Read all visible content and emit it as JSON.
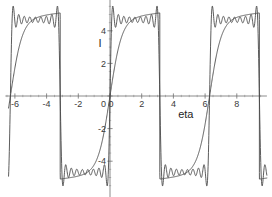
{
  "figure": {
    "kind": "function-plot",
    "background_color": "#ffffff",
    "curve_color": "#4a4a4a",
    "axis_color": "#6f6f6f",
    "tick_color": "#9a9a9a",
    "label_color": "#3a3a3a"
  },
  "axes": {
    "x": {
      "title": "eta",
      "tick_labels": [
        "-6",
        "-4",
        "-2",
        "0",
        "2",
        "4",
        "6",
        "8"
      ],
      "tick_values": [
        -6,
        -4,
        -2,
        0,
        2,
        4,
        6,
        8
      ],
      "minor_tick_step": 0.5,
      "range": [
        -6.6,
        9.9
      ]
    },
    "y": {
      "title": "I",
      "tick_labels": [
        "4",
        "2",
        "0",
        "-2",
        "-4"
      ],
      "tick_values": [
        4,
        2,
        0,
        -2,
        -4
      ],
      "minor_tick_step": 0.5,
      "range": [
        -6.2,
        6.0
      ]
    }
  },
  "chart_data": {
    "type": "line",
    "title": "",
    "xlabel": "eta",
    "ylabel": "I",
    "xlim": [
      -6.6,
      9.9
    ],
    "ylim": [
      -6.2,
      6.0
    ],
    "grid": false,
    "legend": "none",
    "annotations": [],
    "period": 6.283,
    "amplitude": 4.7,
    "discontinuities": [
      -3.142,
      3.142,
      9.425
    ],
    "zero_crossings": [
      -6.283,
      0,
      6.283
    ],
    "series": [
      {
        "name": "square-wave-envelope",
        "style": "solid",
        "points_x": [
          -6.283,
          -6.1,
          -5.9,
          -5.6,
          -5.2,
          -4.8,
          -4.4,
          -4.0,
          -3.6,
          -3.3,
          -3.142,
          -3.142,
          -3.0,
          -2.6,
          -2.2,
          -1.8,
          -1.4,
          -1.0,
          -0.6,
          -0.3,
          -0.1,
          0.0,
          0.1,
          0.3,
          0.6,
          1.0,
          1.4,
          1.8,
          2.2,
          2.6,
          3.0,
          3.142,
          3.142,
          3.3,
          3.6,
          4.0,
          4.4,
          4.8,
          5.2,
          5.6,
          5.9,
          6.1,
          6.283,
          6.4,
          6.6,
          7.0,
          7.4,
          7.8,
          8.2,
          8.6,
          9.0,
          9.3,
          9.425,
          9.425
        ],
        "points_y": [
          0.0,
          1.6,
          2.5,
          3.2,
          3.75,
          4.05,
          4.25,
          4.4,
          4.5,
          4.6,
          4.65,
          -4.65,
          -4.6,
          -4.5,
          -4.4,
          -4.25,
          -4.05,
          -3.75,
          -3.2,
          -2.4,
          -1.2,
          0.0,
          1.2,
          2.4,
          3.2,
          3.75,
          4.05,
          4.25,
          4.4,
          4.5,
          4.6,
          4.65,
          -4.65,
          -4.6,
          -4.5,
          -4.4,
          -4.25,
          -4.05,
          -3.75,
          -3.2,
          -2.5,
          -1.6,
          0.0,
          1.2,
          2.4,
          3.2,
          3.75,
          4.05,
          4.25,
          4.4,
          4.55,
          4.62,
          4.65,
          -4.65
        ]
      },
      {
        "name": "fourier-partial-sum",
        "style": "solid",
        "harmonics": 9,
        "gibbs_overshoot": 1.18
      }
    ]
  }
}
